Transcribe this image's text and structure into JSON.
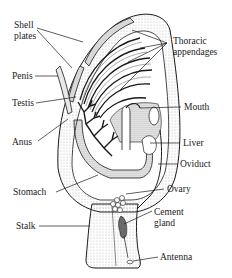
{
  "diagram": {
    "labels": {
      "shell_plates_line1": "Shell",
      "shell_plates_line2": "plates",
      "thoracic_line1": "Thoracic",
      "thoracic_line2": "appendages",
      "penis": "Penis",
      "testis": "Testis",
      "mouth": "Mouth",
      "anus": "Anus",
      "liver": "Liver",
      "oviduct": "Oviduct",
      "stomach": "Stomach",
      "ovary": "Ovary",
      "cement_line1": "Cement",
      "cement_line2": "gland",
      "stalk": "Stalk",
      "antenna": "Antenna"
    },
    "colors": {
      "ink": "#1a1a1a",
      "stipple": "#9a9a9a",
      "background": "#ffffff"
    }
  }
}
